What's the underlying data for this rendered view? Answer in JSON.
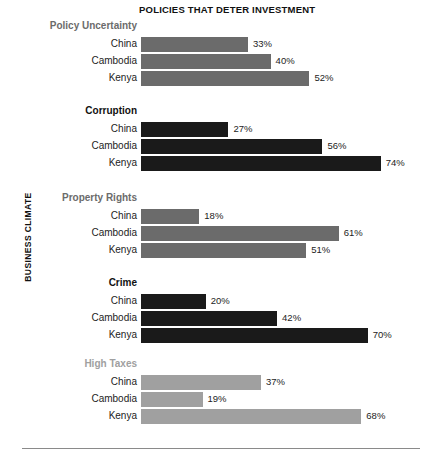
{
  "chart_data": {
    "type": "bar",
    "orientation": "horizontal",
    "title": "POLICIES THAT DETER INVESTMENT",
    "xlabel": "",
    "ylabel": "BUSINESS CLIMATE",
    "grid": false,
    "legend": "none",
    "xlim": [
      0,
      80
    ],
    "value_suffix": "%",
    "categories": [
      "China",
      "Cambodia",
      "Kenya"
    ],
    "groups": [
      {
        "name": "Policy Uncertainty",
        "color": "#6b6b6b",
        "label_color": "#6b6b6b",
        "values": [
          33,
          40,
          52
        ],
        "value_labels": [
          "33%",
          "40%",
          "52%"
        ]
      },
      {
        "name": "Corruption",
        "color": "#1a1a1a",
        "label_color": "#111111",
        "values": [
          27,
          56,
          74
        ],
        "value_labels": [
          "27%",
          "56%",
          "74%"
        ]
      },
      {
        "name": "Property Rights",
        "color": "#6b6b6b",
        "label_color": "#6b6b6b",
        "values": [
          18,
          61,
          51
        ],
        "value_labels": [
          "18%",
          "61%",
          "51%"
        ]
      },
      {
        "name": "Crime",
        "color": "#1a1a1a",
        "label_color": "#111111",
        "values": [
          20,
          42,
          70
        ],
        "value_labels": [
          "20%",
          "42%",
          "70%"
        ]
      },
      {
        "name": "High Taxes",
        "color": "#a0a0a0",
        "label_color": "#a0a0a0",
        "values": [
          37,
          19,
          68
        ],
        "value_labels": [
          "37%",
          "19%",
          "68%"
        ]
      }
    ]
  },
  "layout": {
    "bar_origin_x": 141,
    "px_per_percent": 3.24,
    "bar_height": 15,
    "bar_gap": 2,
    "group_label_offset": 17,
    "group_tops": [
      20,
      105,
      192,
      277,
      358
    ]
  },
  "colors": {
    "background": "#ffffff",
    "rule": "#8a8a8a",
    "text_dark": "#232323",
    "text_title": "#111111"
  }
}
